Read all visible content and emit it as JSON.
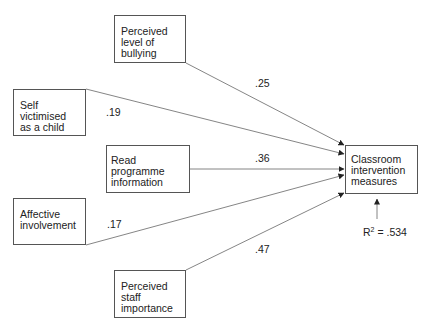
{
  "diagram": {
    "type": "path-model",
    "predictors": [
      {
        "id": "bullying",
        "label": "Perceived\nlevel of\nbullying",
        "coefficient": ".25"
      },
      {
        "id": "self",
        "label": "Self\nvictimised\nas a child",
        "coefficient": ".19"
      },
      {
        "id": "read",
        "label": "Read programme\ninformation",
        "coefficient": ".36"
      },
      {
        "id": "affective",
        "label": "Affective\ninvolvement",
        "coefficient": ".17"
      },
      {
        "id": "staff",
        "label": "Perceived\nstaff\nimportance",
        "coefficient": ".47"
      }
    ],
    "outcome": {
      "id": "classroom",
      "label": "Classroom\nintervention\nmeasures"
    },
    "r_squared": {
      "prefix": "R",
      "sup": "2",
      "value": " = .534"
    }
  }
}
